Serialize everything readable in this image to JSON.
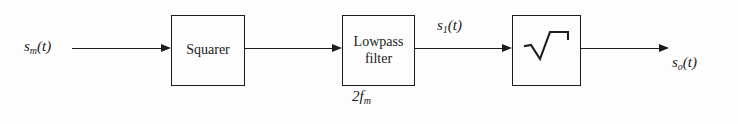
{
  "figure": {
    "type": "signal-processing block diagram",
    "background_color": "#fdfdfd",
    "line_color": "#1c1c1c"
  },
  "signals": {
    "input": {
      "base": "s",
      "sub": "m",
      "arg": "(t)"
    },
    "intermediate": {
      "base": "s",
      "sub": "1",
      "arg": "(t)"
    },
    "output": {
      "base": "s",
      "sub": "o",
      "arg": "(t)"
    }
  },
  "blocks": [
    {
      "id": "squarer",
      "lines": [
        "Squarer"
      ]
    },
    {
      "id": "lowpass",
      "lines": [
        "Lowpass",
        "filter"
      ],
      "annotation_base": "2f",
      "annotation_sub": "m"
    },
    {
      "id": "sqrt",
      "lines": [],
      "icon": "square-root-radical"
    }
  ],
  "labels": {
    "squarer": "Squarer",
    "lowpass_line1": "Lowpass",
    "lowpass_line2": "filter",
    "bandwidth_base": "2f",
    "bandwidth_sub": "m"
  },
  "wires": [
    {
      "from": "input-label",
      "to": "squarer"
    },
    {
      "from": "squarer",
      "to": "lowpass"
    },
    {
      "from": "lowpass",
      "to": "sqrt"
    },
    {
      "from": "sqrt",
      "to": "output-label"
    }
  ]
}
